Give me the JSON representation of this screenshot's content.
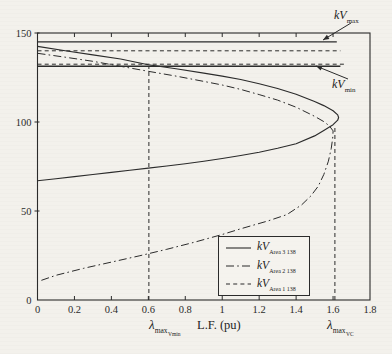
{
  "figure": {
    "background": "#f3f1ec",
    "line_color": "#2b2b2b"
  },
  "chart_data": {
    "type": "line",
    "title": "",
    "xlabel": "L.F. (pu)",
    "ylabel": "",
    "xlim": [
      0,
      1.8
    ],
    "ylim": [
      0,
      150
    ],
    "x_tick_values": [
      0,
      0.2,
      0.4,
      0.6,
      0.8,
      1,
      1.2,
      1.4,
      1.6,
      1.8
    ],
    "x_ticks": [
      "0",
      "0.2",
      "0.4",
      "0.6",
      "0.8",
      "1",
      "1.2",
      "1.4",
      "1.6",
      "1.8"
    ],
    "y_tick_values": [
      0,
      50,
      100,
      150
    ],
    "y_ticks": [
      "0",
      "50",
      "100",
      "150"
    ],
    "grid": false,
    "legend_position": "lower right",
    "series": [
      {
        "name": "kV Area 3 138 (PV nose curve, solid)",
        "slug": "curve-kv-area-3-138",
        "style": "solid",
        "width": 1.15,
        "points": [
          [
            0,
            142.5
          ],
          [
            0.15,
            140.0
          ],
          [
            0.3,
            137.7
          ],
          [
            0.45,
            135.4
          ],
          [
            0.6,
            132.2
          ],
          [
            0.75,
            129.9
          ],
          [
            0.9,
            127.5
          ],
          [
            1.0,
            125.8
          ],
          [
            1.1,
            123.9
          ],
          [
            1.2,
            121.5
          ],
          [
            1.3,
            118.8
          ],
          [
            1.4,
            115.6
          ],
          [
            1.5,
            111.5
          ],
          [
            1.55,
            109.2
          ],
          [
            1.6,
            106.3
          ],
          [
            1.625,
            104.0
          ],
          [
            1.63,
            102.5
          ],
          [
            1.625,
            101.0
          ],
          [
            1.6,
            98.5
          ],
          [
            1.55,
            95.3
          ],
          [
            1.5,
            92.2
          ],
          [
            1.4,
            87.8
          ],
          [
            1.3,
            85.2
          ],
          [
            1.2,
            83.0
          ],
          [
            1.1,
            81.2
          ],
          [
            1.0,
            79.5
          ],
          [
            0.9,
            78.0
          ],
          [
            0.8,
            76.6
          ],
          [
            0.7,
            75.3
          ],
          [
            0.6,
            74.1
          ],
          [
            0.5,
            72.9
          ],
          [
            0.4,
            71.7
          ],
          [
            0.3,
            70.5
          ],
          [
            0.2,
            69.3
          ],
          [
            0.1,
            68.1
          ],
          [
            0,
            67.0
          ]
        ]
      },
      {
        "name": "kV Area 2 138 (PV nose curve, dash-dot)",
        "slug": "curve-kv-area-2-138",
        "style": "dashdot",
        "width": 1.0,
        "points": [
          [
            0,
            138.6
          ],
          [
            0.15,
            136.4
          ],
          [
            0.3,
            134.1
          ],
          [
            0.45,
            131.3
          ],
          [
            0.6,
            128.5
          ],
          [
            0.75,
            125.8
          ],
          [
            0.9,
            122.8
          ],
          [
            1.0,
            120.8
          ],
          [
            1.1,
            118.3
          ],
          [
            1.2,
            115.4
          ],
          [
            1.3,
            112.3
          ],
          [
            1.4,
            108.3
          ],
          [
            1.5,
            103.2
          ],
          [
            1.55,
            100.2
          ],
          [
            1.58,
            97.8
          ],
          [
            1.6,
            95.0
          ],
          [
            1.598,
            91.0
          ],
          [
            1.59,
            85.0
          ],
          [
            1.575,
            78.0
          ],
          [
            1.55,
            70.5
          ],
          [
            1.52,
            64.0
          ],
          [
            1.48,
            58.5
          ],
          [
            1.43,
            53.5
          ],
          [
            1.35,
            48.0
          ],
          [
            1.25,
            44.5
          ],
          [
            1.1,
            40.0
          ],
          [
            1.0,
            36.8
          ],
          [
            0.85,
            32.5
          ],
          [
            0.7,
            28.5
          ],
          [
            0.55,
            24.8
          ],
          [
            0.4,
            21.3
          ],
          [
            0.25,
            17.8
          ],
          [
            0.1,
            13.9
          ],
          [
            0.02,
            11.0
          ]
        ]
      },
      {
        "name": "kV Area 1 138 (flat, dashed)",
        "slug": "line-kv-area-1-138",
        "style": "dashed",
        "width": 1.0,
        "points": [
          [
            0,
            140.0
          ],
          [
            1.64,
            140.0
          ]
        ]
      },
      {
        "name": "kV max limit",
        "slug": "line-kv-max",
        "style": "solid",
        "width": 1.4,
        "points": [
          [
            0,
            145.0
          ],
          [
            1.62,
            145.0
          ]
        ]
      },
      {
        "name": "kV min limit",
        "slug": "line-kv-min",
        "style": "solid",
        "width": 1.4,
        "points": [
          [
            0,
            131.3
          ],
          [
            1.64,
            131.3
          ]
        ]
      },
      {
        "name": "dashed line at kV min",
        "slug": "line-kv-min-dashed",
        "style": "dashed",
        "width": 1.0,
        "points": [
          [
            0,
            132.5
          ],
          [
            1.66,
            132.5
          ]
        ]
      }
    ],
    "markers": [
      {
        "slug": "marker-lambda-max-vmin",
        "x": 0.603,
        "y_top": 131.3
      },
      {
        "slug": "marker-lambda-max-vc",
        "x": 1.61,
        "y_top": 98.0
      }
    ]
  },
  "x_axis": {
    "label": "L.F. (pu)",
    "lambda_vmin": {
      "main": "λ",
      "sub": "max",
      "subsub": "Vmin"
    },
    "lambda_vc": {
      "main": "λ",
      "sub": "max",
      "subsub": "VC"
    }
  },
  "annotations": {
    "kv_max": {
      "main": "kV",
      "sub": "max",
      "arrow_from": [
        351,
        23
      ],
      "arrow_to": [
        323,
        40
      ]
    },
    "kv_min": {
      "main": "kV",
      "sub": "min",
      "arrow_from": [
        348,
        79
      ],
      "arrow_to": [
        316,
        66
      ]
    }
  },
  "legend": {
    "items": [
      {
        "main": "kV",
        "sub": "Area 3 138",
        "style": "solid"
      },
      {
        "main": "kV",
        "sub": "Area 2 138",
        "style": "dashdot"
      },
      {
        "main": "kV",
        "sub": "Area 1 138",
        "style": "dashed"
      }
    ]
  }
}
